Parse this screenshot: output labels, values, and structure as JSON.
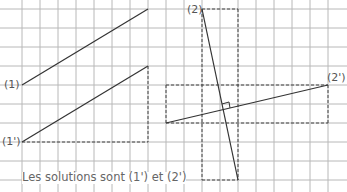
{
  "labels": {
    "line1": "(1)",
    "line1_prime": "(1')",
    "line2": "(2)",
    "line2_prime": "(2')"
  },
  "caption": "Les solutions sont (1') et (2')",
  "colors": {
    "grid": "#b8b8b8",
    "line": "#333333",
    "dashed": "#444444",
    "text": "#555555"
  },
  "grid": {
    "x_start": 22,
    "x_step": 18,
    "x_count": 18,
    "y_start": 9,
    "y_step": 19,
    "y_count": 10
  }
}
